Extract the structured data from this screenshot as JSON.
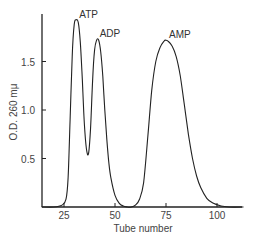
{
  "chart_data": {
    "type": "line",
    "title": "",
    "xlabel": "Tube   number",
    "ylabel": "O.D. 260 mμ",
    "xlim": [
      14,
      113
    ],
    "ylim": [
      0,
      2.0
    ],
    "xticks": [
      25,
      50,
      75,
      100
    ],
    "xtick_labels": [
      "25",
      "50",
      "75",
      "100"
    ],
    "yticks": [
      0.5,
      1.0,
      1.5
    ],
    "ytick_labels": [
      "0.5",
      "1.0",
      "1.5"
    ],
    "grid": false,
    "legend": null,
    "annotations": [
      {
        "text": "ATP",
        "x": 31,
        "y": 1.93
      },
      {
        "text": "ADP",
        "x": 41,
        "y": 1.73
      },
      {
        "text": "AMP",
        "x": 75,
        "y": 1.72
      }
    ],
    "series": [
      {
        "name": "Absorbance",
        "x": [
          14,
          20,
          24,
          26,
          27,
          28,
          29,
          30,
          31,
          32,
          33,
          34,
          35,
          36,
          37,
          38,
          39,
          40,
          41,
          42,
          43,
          44,
          45,
          46,
          47,
          48,
          50,
          52,
          54,
          56,
          58,
          60,
          62,
          64,
          66,
          68,
          70,
          72,
          74,
          75,
          76,
          78,
          80,
          82,
          84,
          86,
          88,
          90,
          92,
          95,
          98,
          102,
          106,
          113
        ],
        "y": [
          0.0,
          0.0,
          0.02,
          0.08,
          0.3,
          0.9,
          1.55,
          1.88,
          1.93,
          1.9,
          1.7,
          1.3,
          0.85,
          0.6,
          0.55,
          0.8,
          1.3,
          1.62,
          1.72,
          1.72,
          1.6,
          1.35,
          1.0,
          0.7,
          0.45,
          0.3,
          0.12,
          0.04,
          0.01,
          0.0,
          0.0,
          0.02,
          0.08,
          0.25,
          0.7,
          1.2,
          1.5,
          1.64,
          1.71,
          1.72,
          1.71,
          1.66,
          1.55,
          1.35,
          1.05,
          0.75,
          0.5,
          0.32,
          0.2,
          0.09,
          0.04,
          0.01,
          0.0,
          0.0
        ]
      }
    ]
  }
}
